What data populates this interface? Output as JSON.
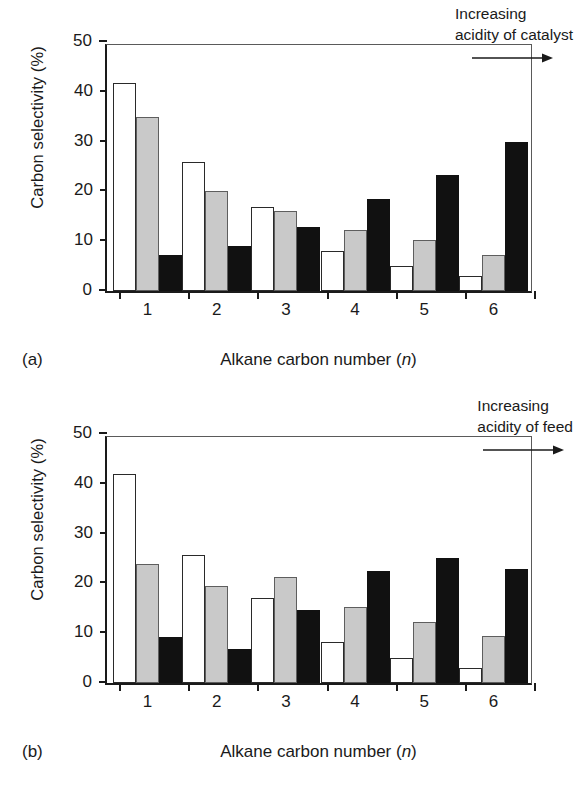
{
  "figure": {
    "background": "#ffffff",
    "series_colors": {
      "white": "#ffffff",
      "gray": "#c9c9c9",
      "black": "#111111"
    }
  },
  "panels": [
    {
      "tag": "(a)",
      "annotation_line1": "Increasing",
      "annotation_line2": "acidity of catalyst",
      "arrow": "right-arrow-icon"
    },
    {
      "tag": "(b)",
      "annotation_line1": "Increasing",
      "annotation_line2": "acidity of feed",
      "arrow": "right-arrow-icon"
    }
  ],
  "axis": {
    "ylabel": "Carbon selectivity (%)",
    "xlabel_pre": "Alkane carbon number (",
    "xlabel_italic": "n",
    "xlabel_post": ")",
    "yticks": [
      "0",
      "10",
      "20",
      "30",
      "40",
      "50"
    ],
    "xticks": [
      "1",
      "2",
      "3",
      "4",
      "5",
      "6"
    ]
  },
  "chart_data": [
    {
      "type": "bar",
      "title": "(a) Increasing acidity of catalyst",
      "xlabel": "Alkane carbon number (n)",
      "ylabel": "Carbon selectivity (%)",
      "ylim": [
        0,
        50
      ],
      "ytick_step": 10,
      "grid": false,
      "legend": "none",
      "categories": [
        "1",
        "2",
        "3",
        "4",
        "5",
        "6"
      ],
      "series": [
        {
          "name": "low acidity",
          "color": "#ffffff",
          "values": [
            41.8,
            26.0,
            16.9,
            8.0,
            5.0,
            3.0
          ]
        },
        {
          "name": "medium acidity",
          "color": "#c9c9c9",
          "values": [
            35.0,
            20.1,
            16.0,
            12.2,
            10.2,
            7.2
          ]
        },
        {
          "name": "high acidity",
          "color": "#111111",
          "values": [
            7.3,
            9.1,
            12.9,
            18.4,
            23.3,
            29.9
          ]
        }
      ],
      "annotation": "Increasing acidity of catalyst"
    },
    {
      "type": "bar",
      "title": "(b) Increasing acidity of feed",
      "xlabel": "Alkane carbon number (n)",
      "ylabel": "Carbon selectivity (%)",
      "ylim": [
        0,
        50
      ],
      "ytick_step": 10,
      "grid": false,
      "legend": "none",
      "categories": [
        "1",
        "2",
        "3",
        "4",
        "5",
        "6"
      ],
      "series": [
        {
          "name": "low acidity",
          "color": "#ffffff",
          "values": [
            42.0,
            25.7,
            17.0,
            8.2,
            5.0,
            3.1
          ]
        },
        {
          "name": "medium acidity",
          "color": "#c9c9c9",
          "values": [
            23.8,
            19.5,
            21.2,
            15.2,
            12.2,
            9.4
          ]
        },
        {
          "name": "high acidity",
          "color": "#111111",
          "values": [
            9.2,
            6.8,
            14.6,
            22.5,
            25.2,
            22.9
          ]
        }
      ],
      "annotation": "Increasing acidity of feed"
    }
  ]
}
